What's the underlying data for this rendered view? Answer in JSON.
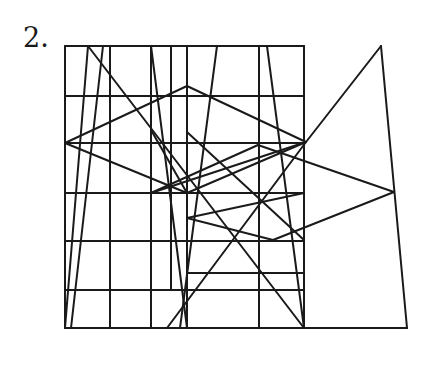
{
  "problem": {
    "number_label": "2."
  },
  "diagram": {
    "stroke_color": "#1a1a1a",
    "background": "#ffffff",
    "box": {
      "x1": 65,
      "y1": 46,
      "x2": 304,
      "y2": 328
    },
    "segments": [
      [
        65,
        46,
        304,
        46
      ],
      [
        65,
        328,
        304,
        328
      ],
      [
        65,
        46,
        65,
        328
      ],
      [
        304,
        46,
        304,
        328
      ],
      [
        65,
        96,
        304,
        96
      ],
      [
        65,
        143,
        304,
        143
      ],
      [
        65,
        193,
        304,
        193
      ],
      [
        65,
        241,
        304,
        241
      ],
      [
        65,
        290,
        304,
        290
      ],
      [
        187,
        273,
        304,
        273
      ],
      [
        110,
        46,
        110,
        328
      ],
      [
        151,
        46,
        151,
        328
      ],
      [
        259,
        46,
        259,
        328
      ],
      [
        171,
        46,
        171,
        290
      ],
      [
        187,
        46,
        187,
        328
      ],
      [
        88,
        46,
        65,
        328
      ],
      [
        103,
        46,
        71,
        328
      ],
      [
        88,
        46,
        304,
        328
      ],
      [
        151,
        46,
        187,
        328
      ],
      [
        217,
        46,
        180,
        328
      ],
      [
        267,
        46,
        304,
        328
      ],
      [
        65,
        143,
        187,
        86
      ],
      [
        187,
        86,
        306,
        142
      ],
      [
        65,
        143,
        187,
        193
      ],
      [
        187,
        193,
        306,
        142
      ],
      [
        151,
        193,
        258,
        145
      ],
      [
        258,
        145,
        394,
        192
      ],
      [
        151,
        193,
        306,
        142
      ],
      [
        151,
        130,
        187,
        193
      ],
      [
        187,
        132,
        304,
        240
      ],
      [
        187,
        218,
        304,
        193
      ],
      [
        187,
        218,
        273,
        240
      ],
      [
        273,
        240,
        394,
        192
      ],
      [
        167,
        328,
        306,
        142
      ],
      [
        306,
        142,
        381,
        46
      ],
      [
        381,
        46,
        407,
        328
      ],
      [
        304,
        328,
        407,
        328
      ]
    ]
  }
}
